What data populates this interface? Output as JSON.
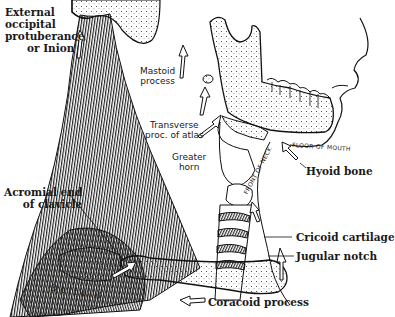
{
  "figure": {
    "labels": {
      "external_occipital": [
        "External",
        "occipital",
        "protuberance",
        "or Inion"
      ],
      "mastoid": [
        "Mastoid",
        "process"
      ],
      "transverse_atlas": [
        "Transverse",
        "proc. of atlas"
      ],
      "greater_horn": [
        "Greater",
        "horn"
      ],
      "floor_of_mouth": "FLOOR OF MOUTH",
      "hyoid_bone": "Hyoid bone",
      "front_of_neck": "FRONT OF NECK",
      "acromial_end": [
        "Acromial end",
        "of clavicle"
      ],
      "cricoid": "Cricoid cartilage",
      "jugular_notch": "Jugular notch",
      "deltoid": "Deltoid",
      "coracoid": "Coracoid process"
    },
    "colors": {
      "ink": "#1a1a1a",
      "background": "#ffffff"
    }
  }
}
